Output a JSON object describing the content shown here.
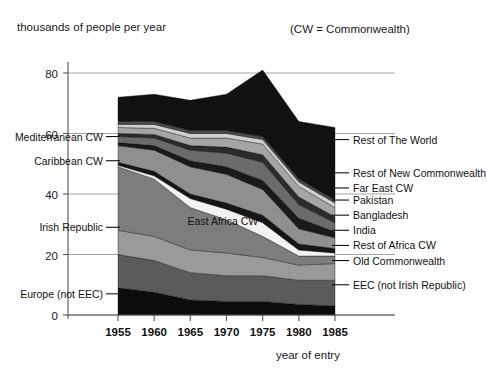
{
  "figure": {
    "ylabel_top": "thousands of people per year",
    "note": "(CW = Commonwealth)",
    "xlabel": "year of entry"
  },
  "chart_data": {
    "type": "area",
    "title": "",
    "subtitle": "",
    "xlabel": "year of entry",
    "ylabel": "thousands of people per year",
    "note": "(CW = Commonwealth)",
    "stacked": true,
    "grid": true,
    "legend_position": "inline-annotations",
    "xlim": [
      1955,
      1985
    ],
    "ylim": [
      0,
      85
    ],
    "xticks": [
      1955,
      1960,
      1965,
      1970,
      1975,
      1980,
      1985
    ],
    "yticks": [
      0,
      20,
      40,
      60,
      80
    ],
    "x": [
      1955,
      1960,
      1965,
      1970,
      1975,
      1980,
      1985
    ],
    "series": [
      {
        "name": "Europe (not EEC)",
        "color": "#0d0d0d",
        "values": [
          9.0,
          7.5,
          5.0,
          4.5,
          4.5,
          3.5,
          3.0
        ]
      },
      {
        "name": "EEC (not Irish Republic)",
        "color": "#5b5b5b",
        "values": [
          11.0,
          10.5,
          9.0,
          8.5,
          8.5,
          8.0,
          8.5
        ]
      },
      {
        "name": "Old Commonwealth",
        "color": "#9a9a9a",
        "values": [
          8.0,
          8.0,
          7.5,
          7.5,
          6.0,
          5.0,
          5.5
        ]
      },
      {
        "name": "Irish Republic",
        "color": "#7d7d7d",
        "values": [
          21.0,
          19.0,
          14.0,
          11.0,
          7.0,
          3.0,
          2.5
        ]
      },
      {
        "name": "East Africa CW",
        "color": "#f2f2f2",
        "values": [
          0.5,
          1.0,
          3.0,
          3.5,
          4.5,
          2.0,
          1.0
        ]
      },
      {
        "name": "Rest of Africa CW",
        "color": "#151515",
        "values": [
          1.0,
          1.5,
          1.5,
          2.0,
          2.5,
          2.0,
          1.5
        ]
      },
      {
        "name": "India",
        "color": "#8f8f8f",
        "values": [
          5.5,
          7.0,
          9.0,
          9.5,
          8.5,
          5.0,
          3.5
        ]
      },
      {
        "name": "Bangladesh",
        "color": "#1a1a1a",
        "values": [
          1.0,
          1.5,
          2.0,
          2.5,
          3.0,
          3.5,
          2.0
        ]
      },
      {
        "name": "Pakistan",
        "color": "#6b6b6b",
        "values": [
          2.0,
          2.5,
          3.5,
          4.5,
          6.0,
          4.5,
          3.0
        ]
      },
      {
        "name": "Far East CW",
        "color": "#2b2b2b",
        "values": [
          1.0,
          1.2,
          1.5,
          2.0,
          2.5,
          2.5,
          2.0
        ]
      },
      {
        "name": "Rest of New Commonwealth",
        "color": "#a5a5a5",
        "values": [
          2.0,
          2.0,
          2.5,
          3.0,
          3.5,
          3.5,
          3.0
        ]
      },
      {
        "name": "Mediterranean CW",
        "color": "#d0d0d0",
        "values": [
          1.0,
          1.3,
          1.5,
          1.5,
          1.5,
          1.5,
          1.5
        ]
      },
      {
        "name": "Caribbean CW",
        "color": "#4a4a4a",
        "values": [
          1.0,
          1.0,
          1.0,
          1.0,
          1.0,
          1.0,
          1.0
        ]
      },
      {
        "name": "Rest of The World",
        "color": "#111111",
        "values": [
          8.0,
          9.0,
          10.0,
          12.0,
          22.0,
          19.0,
          24.0
        ]
      }
    ],
    "left_annotations": [
      {
        "label": "Mediterranean CW",
        "value": 59
      },
      {
        "label": "Caribbean CW",
        "value": 51
      },
      {
        "label": "Irish Republic",
        "value": 29
      },
      {
        "label": "Europe (not EEC)",
        "value": 7
      }
    ],
    "right_annotations": [
      {
        "label": "Rest of The World",
        "value": 58
      },
      {
        "label": "Rest of New Commonwealth",
        "value": 47
      },
      {
        "label": "Far East CW",
        "value": 42
      },
      {
        "label": "Pakistan",
        "value": 38
      },
      {
        "label": "Bangladesh",
        "value": 33
      },
      {
        "label": "India",
        "value": 28
      },
      {
        "label": "Rest of Africa CW",
        "value": 23
      },
      {
        "label": "Old Commonwealth",
        "value": 18
      },
      {
        "label": "EEC (not Irish Republic)",
        "value": 10
      }
    ],
    "inline_annotations": [
      {
        "label": "East Africa CW",
        "x": 1969.5,
        "value": 31
      }
    ]
  }
}
